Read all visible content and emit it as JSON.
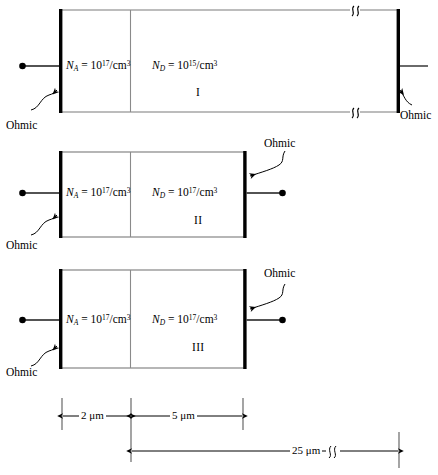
{
  "figure": {
    "units_label": "μm",
    "colors": {
      "contact": "#000000",
      "outline": "#7a7a7a",
      "junction": "#8a8a8a",
      "lead": "#1a1a1a",
      "background": "#ffffff"
    }
  },
  "structures": [
    {
      "id": "I",
      "roman_label": "I",
      "p_region": {
        "symbol": "N",
        "subscript": "A",
        "equals": "=",
        "mantissa": "10",
        "exponent": "17",
        "units": "/cm",
        "units_exponent": "3",
        "full_text": "NA = 1017/cm3"
      },
      "n_region": {
        "symbol": "N",
        "subscript": "D",
        "equals": "=",
        "mantissa": "10",
        "exponent": "15",
        "units": "/cm",
        "units_exponent": "3",
        "full_text": "ND = 1015/cm3"
      },
      "left_contact_label": "Ohmic",
      "right_contact_label": "Ohmic",
      "has_break_symbol": true,
      "left_terminal_dot": true,
      "right_terminal_dot": false
    },
    {
      "id": "II",
      "roman_label": "II",
      "p_region": {
        "symbol": "N",
        "subscript": "A",
        "equals": "=",
        "mantissa": "10",
        "exponent": "17",
        "units": "/cm",
        "units_exponent": "3",
        "full_text": "NA = 1017/cm3"
      },
      "n_region": {
        "symbol": "N",
        "subscript": "D",
        "equals": "=",
        "mantissa": "10",
        "exponent": "17",
        "units": "/cm",
        "units_exponent": "3",
        "full_text": "ND = 1017/cm3"
      },
      "left_contact_label": "Ohmic",
      "right_contact_label": "Ohmic",
      "has_break_symbol": false,
      "left_terminal_dot": true,
      "right_terminal_dot": true
    },
    {
      "id": "III",
      "roman_label": "III",
      "p_region": {
        "symbol": "N",
        "subscript": "A",
        "equals": "=",
        "mantissa": "10",
        "exponent": "17",
        "units": "/cm",
        "units_exponent": "3",
        "full_text": "NA = 1017/cm3"
      },
      "n_region": {
        "symbol": "N",
        "subscript": "D",
        "equals": "=",
        "mantissa": "10",
        "exponent": "17",
        "units": "/cm",
        "units_exponent": "3",
        "full_text": "ND = 1017/cm3"
      },
      "left_contact_label": "Ohmic",
      "right_contact_label": "Ohmic",
      "has_break_symbol": false,
      "left_terminal_dot": true,
      "right_terminal_dot": true
    }
  ],
  "dimensions": [
    {
      "name": "p-region-width",
      "value": "2 μm",
      "row": 1
    },
    {
      "name": "n-region-width",
      "value": "5 μm",
      "row": 1
    },
    {
      "name": "total-length",
      "value": "25 μm",
      "row": 2,
      "has_break_symbol": true
    }
  ]
}
